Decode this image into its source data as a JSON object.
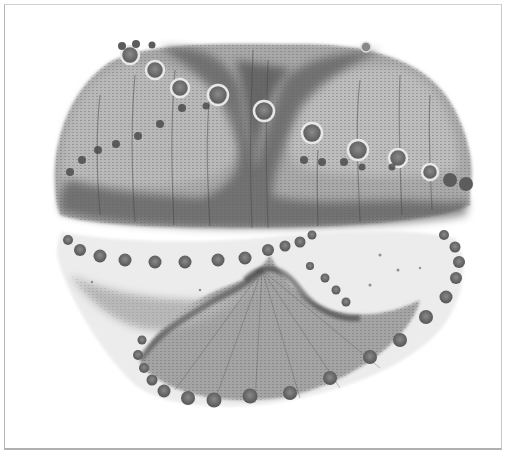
{
  "image": {
    "subject": "grayscale micrograph of a two-valve bead-ringed specimen (frustule-like), upper and lower halves",
    "palette": {
      "background": "#ffffff",
      "frame": "#bcbcbc",
      "shell_light": "#c8c8c8",
      "shell_mid": "#9a9a9a",
      "shell_dark": "#4a4a4a",
      "bead": "#6a6a6a",
      "bead_ring": "#e6e6e6"
    },
    "parts": [
      {
        "name": "upper-valve",
        "bounds": [
          50,
          38,
          478,
          228
        ]
      },
      {
        "name": "lower-valve",
        "bounds": [
          58,
          225,
          468,
          410
        ]
      }
    ]
  }
}
